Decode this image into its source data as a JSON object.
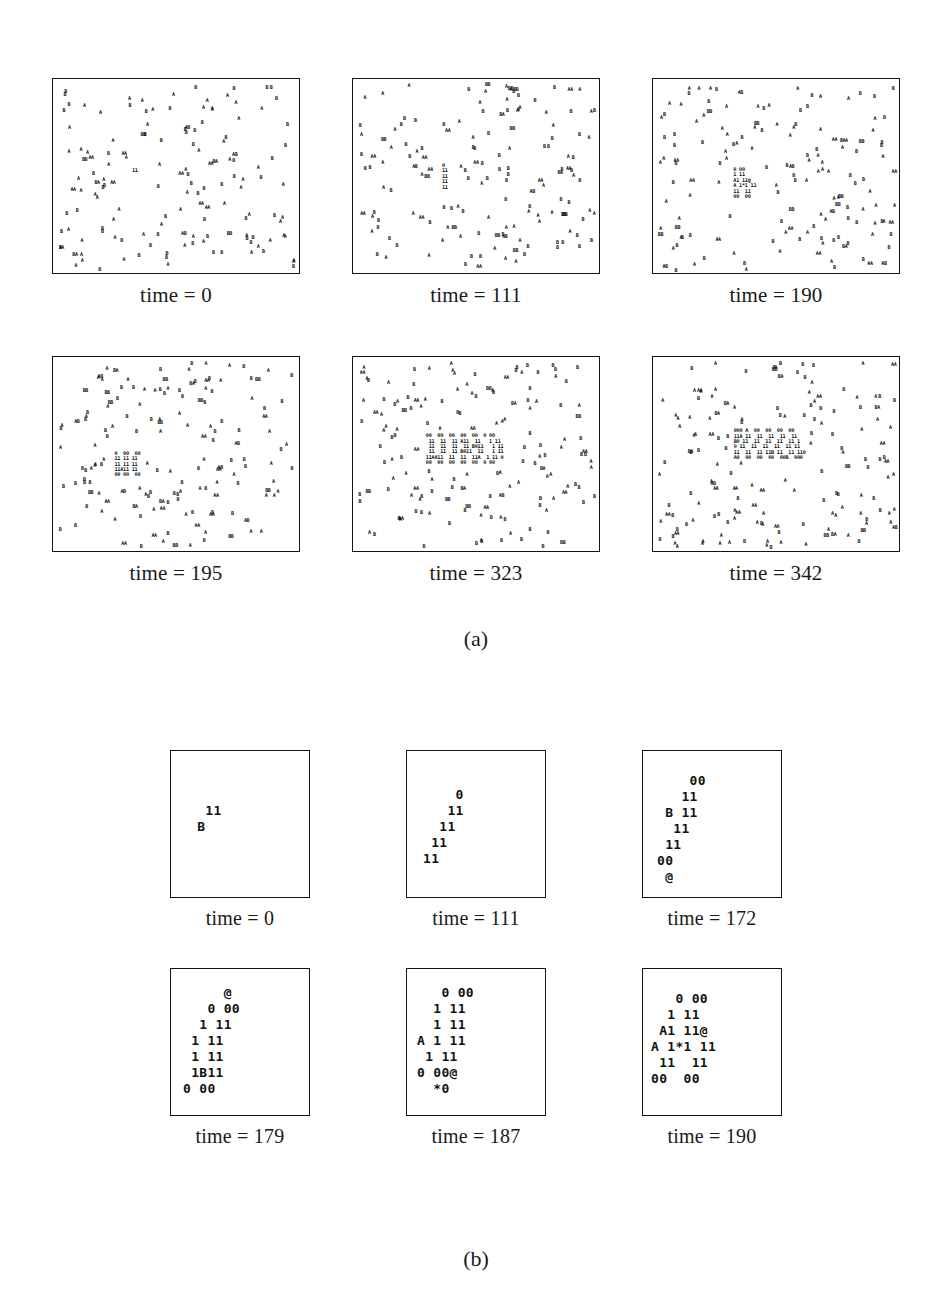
{
  "figure": {
    "subfigure_labels": {
      "a": "(a)",
      "b": "(b)"
    }
  },
  "panels_a": [
    {
      "caption": "time = 0"
    },
    {
      "caption": "time = 111"
    },
    {
      "caption": "time = 190"
    },
    {
      "caption": "time = 195"
    },
    {
      "caption": "time = 323"
    },
    {
      "caption": "time = 342"
    }
  ],
  "panels_b": [
    {
      "caption": "time = 0",
      "cell_lines": [
        {
          "text": "  11",
          "x": 18,
          "y": 52
        },
        {
          "text": " B",
          "x": 18,
          "y": 68
        }
      ]
    },
    {
      "caption": "time = 111",
      "cell_lines": [
        {
          "text": "    0",
          "x": 16,
          "y": 36
        },
        {
          "text": "   11",
          "x": 16,
          "y": 52
        },
        {
          "text": "  11",
          "x": 16,
          "y": 68
        },
        {
          "text": " 11",
          "x": 16,
          "y": 84
        },
        {
          "text": "11",
          "x": 16,
          "y": 100
        }
      ]
    },
    {
      "caption": "time = 172",
      "cell_lines": [
        {
          "text": "    00",
          "x": 14,
          "y": 22
        },
        {
          "text": "   11",
          "x": 14,
          "y": 38
        },
        {
          "text": " B 11",
          "x": 14,
          "y": 54
        },
        {
          "text": "  11",
          "x": 14,
          "y": 70
        },
        {
          "text": " 11",
          "x": 14,
          "y": 86
        },
        {
          "text": "00",
          "x": 14,
          "y": 102
        },
        {
          "text": " @",
          "x": 14,
          "y": 118
        }
      ]
    },
    {
      "caption": "time = 179",
      "cell_lines": [
        {
          "text": "     @",
          "x": 12,
          "y": 16
        },
        {
          "text": "   0 00",
          "x": 12,
          "y": 32
        },
        {
          "text": "  1 11",
          "x": 12,
          "y": 48
        },
        {
          "text": " 1 11",
          "x": 12,
          "y": 64
        },
        {
          "text": " 1 11",
          "x": 12,
          "y": 80
        },
        {
          "text": " 1B11",
          "x": 12,
          "y": 96
        },
        {
          "text": "0 00",
          "x": 12,
          "y": 112
        }
      ]
    },
    {
      "caption": "time = 187",
      "cell_lines": [
        {
          "text": "   0 00",
          "x": 10,
          "y": 16
        },
        {
          "text": "  1 11",
          "x": 10,
          "y": 32
        },
        {
          "text": "  1 11",
          "x": 10,
          "y": 48
        },
        {
          "text": "A 1 11",
          "x": 10,
          "y": 64
        },
        {
          "text": " 1 11",
          "x": 10,
          "y": 80
        },
        {
          "text": "0 00@",
          "x": 10,
          "y": 96
        },
        {
          "text": "  *0",
          "x": 10,
          "y": 112
        }
      ]
    },
    {
      "caption": "time = 190",
      "cell_lines": [
        {
          "text": "   0 00",
          "x": 8,
          "y": 22
        },
        {
          "text": "  1 11",
          "x": 8,
          "y": 38
        },
        {
          "text": " A1 11@",
          "x": 8,
          "y": 54
        },
        {
          "text": "A 1*1 11",
          "x": 8,
          "y": 70
        },
        {
          "text": " 11  11",
          "x": 8,
          "y": 86
        },
        {
          "text": "00  00",
          "x": 8,
          "y": 102
        }
      ]
    }
  ],
  "chart_data": {
    "type": "scatter",
    "xlabel": "",
    "ylabel": "",
    "grid": false,
    "legend": "none",
    "panel_symbols": [
      "A",
      "B",
      "0",
      "1",
      "@",
      "*"
    ],
    "subpanels": [
      {
        "group": "a",
        "caption": "time = 0",
        "particle_count": 148,
        "cluster_present": true,
        "cluster_lines": [
          "11"
        ],
        "cluster_center": [
          0.33,
          0.47
        ]
      },
      {
        "group": "a",
        "caption": "time = 111",
        "particle_count": 152,
        "cluster_present": true,
        "cluster_lines": [
          "0",
          "11",
          "11",
          "11",
          "11"
        ],
        "cluster_center": [
          0.37,
          0.5
        ]
      },
      {
        "group": "a",
        "caption": "time = 190",
        "particle_count": 155,
        "cluster_present": true,
        "cluster_lines": [
          "0 00",
          "1 11",
          "A1 11@",
          "A 1*1 11",
          "11  11",
          "00  00"
        ],
        "cluster_center": [
          0.37,
          0.53
        ]
      },
      {
        "group": "a",
        "caption": "time = 195",
        "particle_count": 158,
        "cluster_present": true,
        "cluster_lines": [
          "0  00  00",
          "11 11 11",
          "11 11 11",
          "11A11 11",
          "00 00  00"
        ],
        "cluster_center": [
          0.3,
          0.55
        ]
      },
      {
        "group": "a",
        "caption": "time = 323",
        "particle_count": 162,
        "cluster_present": true,
        "cluster_lines": [
          "00  00  00  00  00  0 00",
          " 11  11  11 A11  11   1 11",
          " 11  11  11  11 B011   1 11",
          " 11  11  11 B011  11   1 11",
          "11AA11  11  11  11A  1 11 0",
          "00  00  00  00  00  0 00"
        ],
        "cluster_center": [
          0.45,
          0.47
        ]
      },
      {
        "group": "a",
        "caption": "time = 342",
        "particle_count": 166,
        "cluster_present": true,
        "cluster_lines": [
          "000 A  00  00  00  00",
          "11A 11  11  11  11  11",
          "B0 11  11  11  11  11 1",
          "0 11  11  11  11  11 11",
          "11  11  11 11B 11  11 110",
          "A0  00  00  00  00B  000",
          "  A"
        ],
        "cluster_center": [
          0.47,
          0.46
        ]
      },
      {
        "group": "b",
        "caption": "time = 0",
        "cluster_lines": [
          "  11",
          " B"
        ]
      },
      {
        "group": "b",
        "caption": "time = 111",
        "cluster_lines": [
          "    0",
          "   11",
          "  11",
          " 11",
          "11"
        ]
      },
      {
        "group": "b",
        "caption": "time = 172",
        "cluster_lines": [
          "    00",
          "   11",
          " B 11",
          "  11",
          " 11",
          "00",
          " @"
        ]
      },
      {
        "group": "b",
        "caption": "time = 179",
        "cluster_lines": [
          "     @",
          "   0 00",
          "  1 11",
          " 1 11",
          " 1 11",
          " 1B11",
          "0 00"
        ]
      },
      {
        "group": "b",
        "caption": "time = 187",
        "cluster_lines": [
          "   0 00",
          "  1 11",
          "  1 11",
          "A 1 11",
          " 1 11",
          "0 00@",
          "  *0"
        ]
      },
      {
        "group": "b",
        "caption": "time = 190",
        "cluster_lines": [
          "   0 00",
          "  1 11",
          " A1 11@",
          "A 1*1 11",
          " 11  11",
          "00  00"
        ]
      }
    ]
  }
}
